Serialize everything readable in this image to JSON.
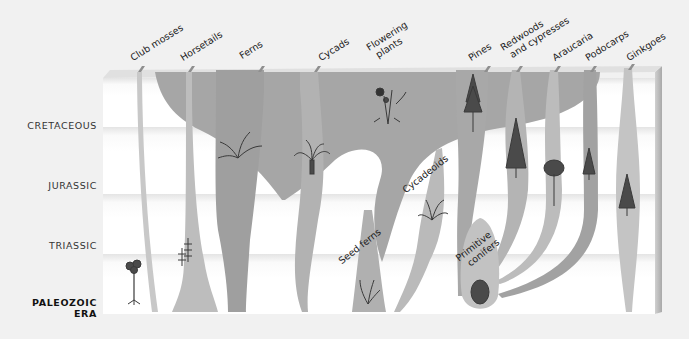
{
  "diagram": {
    "type": "plant evolutionary tree across geologic time",
    "eras": [
      {
        "id": "cretaceous",
        "label": "CRETACEOUS",
        "bold": false
      },
      {
        "id": "jurassic",
        "label": "JURASSIC",
        "bold": false
      },
      {
        "id": "triassic",
        "label": "TRIASSIC",
        "bold": false
      },
      {
        "id": "paleozoic",
        "label": "PALEOZOIC\nERA",
        "line1": "PALEOZOIC",
        "line2": "ERA",
        "bold": true
      }
    ],
    "groups": [
      {
        "id": "club-mosses",
        "label": "Club mosses",
        "icon": "club-moss-plant-icon"
      },
      {
        "id": "horsetails",
        "label": "Horsetails",
        "icon": "horsetail-plant-icon"
      },
      {
        "id": "ferns",
        "label": "Ferns",
        "icon": "fern-icon"
      },
      {
        "id": "cycads",
        "label": "Cycads",
        "icon": "cycad-palm-icon"
      },
      {
        "id": "flowering-plants",
        "label": "Flowering plants",
        "line1": "Flowering",
        "line2": "plants",
        "icon": "flower-icon"
      },
      {
        "id": "pines",
        "label": "Pines",
        "icon": "pine-tree-icon"
      },
      {
        "id": "redwoods",
        "label": "Redwoods and cypresses",
        "line1": "Redwoods",
        "line2": "and cypresses",
        "icon": "redwood-tree-icon"
      },
      {
        "id": "araucaria",
        "label": "Araucaria",
        "icon": "araucaria-tree-icon"
      },
      {
        "id": "podocarps",
        "label": "Podocarps",
        "icon": "podocarp-tree-icon"
      },
      {
        "id": "ginkgoes",
        "label": "Ginkgoes",
        "icon": "ginkgo-tree-icon"
      }
    ],
    "extinct_groups": [
      {
        "id": "seed-ferns",
        "label": "Seed ferns",
        "icon": "seed-fern-icon"
      },
      {
        "id": "cycadeoids",
        "label": "Cycadeoids",
        "icon": "cycadeoid-icon"
      },
      {
        "id": "primitive-conifers",
        "label": "Primitive conifers",
        "line1": "Primitive",
        "line2": "conifers",
        "icon": "primitive-conifer-icon"
      }
    ],
    "colors": {
      "background": "#f1f1f1",
      "band_light": "#fbfbfb",
      "band_shade": "#e6e6e6",
      "lineage_light": "#c9c9c9",
      "lineage_mid": "#b3b3b3",
      "lineage_dark": "#9c9c9c",
      "flowering_spread": "#a8a8a8",
      "plant_icon": "#3a3a3a"
    }
  }
}
